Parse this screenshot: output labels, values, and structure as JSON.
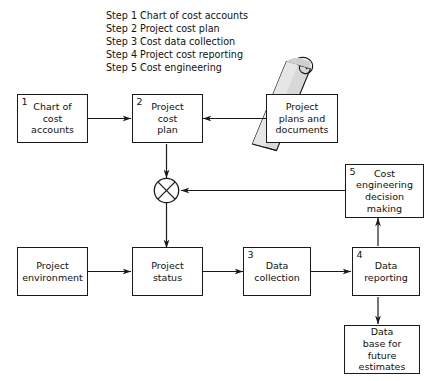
{
  "steps": {
    "items": [
      "Step 1 Chart of cost accounts",
      "Step 2 Project cost plan",
      "Step 3 Cost data collection",
      "Step 4 Project cost reporting",
      "Step 5 Cost engineering"
    ]
  },
  "nodes": {
    "chart_of_cost_accounts": {
      "number": "1",
      "label": "Chart of\ncost\naccounts"
    },
    "project_cost_plan": {
      "number": "2",
      "label": "Project\ncost\nplan"
    },
    "project_plans_documents": {
      "number": "",
      "label": "Project\nplans and\ndocuments"
    },
    "cost_engineering_decision": {
      "number": "5",
      "label": "Cost\nengineering\ndecision\nmaking"
    },
    "project_environment": {
      "number": "",
      "label": "Project\nenvironment"
    },
    "project_status": {
      "number": "",
      "label": "Project\nstatus"
    },
    "data_collection": {
      "number": "3",
      "label": "Data\ncollection"
    },
    "data_reporting": {
      "number": "4",
      "label": "Data\nreporting"
    },
    "data_base_future_estimates": {
      "number": "",
      "label": "Data\nbase for\nfuture\nestimates"
    }
  },
  "junction": {
    "symbol": "x-circle-junction"
  },
  "scroll": {
    "name": "rolled-document"
  },
  "colors": {
    "stroke": "#1a1a1a",
    "background": "#ffffff",
    "scroll_fill": "#d8d8d8",
    "scroll_fill_light": "#e6e6e6"
  }
}
